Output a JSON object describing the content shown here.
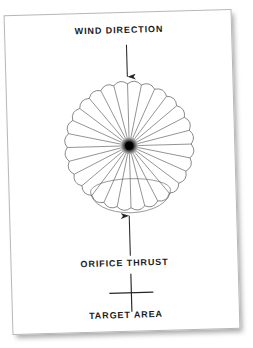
{
  "figure": {
    "type": "technical-diagram",
    "paper_color": "#ffffff",
    "ink_color": "#3a3a3a",
    "text_color": "#1b1b1b",
    "shadow_color": "rgba(0,0,0,0.34)"
  },
  "labels": {
    "wind_direction": "WIND DIRECTION",
    "orifice_thrust": "ORIFICE THRUST",
    "target_area": "TARGET AREA"
  },
  "markers": {
    "wind_arrow": "arrow-down",
    "thrust_arrow": "arrow-up",
    "target_cross": "plus-marker"
  },
  "canopy": {
    "center_x": 121,
    "center_y": 133,
    "radius": 68,
    "gore_count": 28,
    "scallop_depth": 6,
    "hub_radius": 9,
    "hub_core_radius": 4,
    "skirt_ellipse_rx": 40,
    "skirt_ellipse_ry": 22,
    "skirt_center_y": 178
  },
  "arrows": {
    "wind": {
      "x": 121,
      "y_start": 32,
      "y_end": 64
    },
    "thrust": {
      "x": 119,
      "y_start": 243,
      "y_end": 203
    }
  },
  "cross": {
    "x": 119,
    "y": 280,
    "half_w": 22,
    "half_h": 19
  }
}
